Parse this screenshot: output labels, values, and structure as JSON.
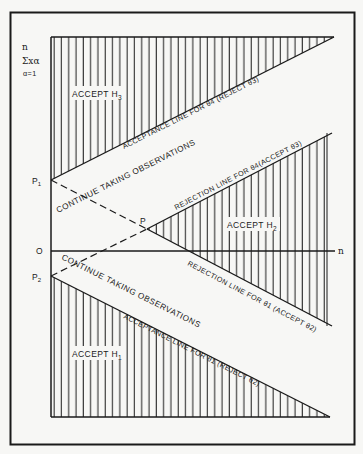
{
  "figure": {
    "y_axis_label": {
      "line1": "n",
      "line2": "Σxα",
      "line3": "α=1"
    },
    "x_axis_label": "n",
    "origin_label": "O",
    "points": {
      "p1": "P",
      "p1_sub": "1",
      "p2": "P",
      "p2_sub": "2",
      "p": "P"
    },
    "regions": {
      "h3": {
        "text": "ACCEPT H",
        "sub": "3"
      },
      "h2": {
        "text": "ACCEPT H",
        "sub": "2"
      },
      "h1": {
        "text": "ACCEPT H",
        "sub": "1"
      },
      "continue_upper": "CONTINUE TAKING OBSERVATIONS",
      "continue_lower": "CONTINUE TAKING OBSERVATIONS"
    },
    "lines": {
      "acceptance_theta4": "ACCEPTANCE LINE FOR θ4 (REJECT θ3)",
      "rejection_theta4": "REJECTION LINE FOR θ4(ACCEPT θ3)",
      "rejection_theta1": "REJECTION LINE FOR θ1 (ACCEPT θ2)",
      "acceptance_theta1": "ACCEPTANCE LINE FOR θ1 (REJECT θ2)"
    },
    "colors": {
      "ink": "#1a1a1a",
      "paper": "#f7f7f5"
    }
  }
}
